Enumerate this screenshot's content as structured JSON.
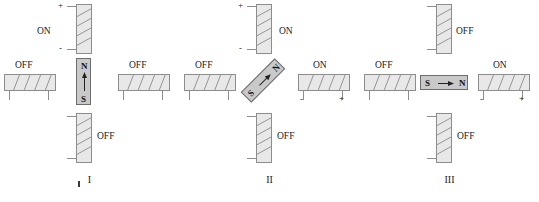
{
  "figure": {
    "type": "physics-diagram",
    "background_color": "#ffffff",
    "magnet_fill": "#c9c9c9",
    "coil_fill": "#e8e8e8",
    "stroke_color": "#8d8d8d",
    "labels": {
      "on": "ON",
      "off": "OFF",
      "plus": "+",
      "minus": "-",
      "north": "N",
      "south": "S"
    }
  },
  "panels": [
    {
      "id": "I",
      "caption": "I",
      "magnet": {
        "orientation": "vertical",
        "top_pole": "N",
        "bottom_pole": "S",
        "arrow_direction": "up",
        "angle_deg": 0
      },
      "coils": {
        "top": {
          "state": "ON",
          "label": "ON",
          "label_side": "left",
          "plus": "+",
          "minus": "-",
          "terminals_side": "left"
        },
        "left": {
          "state": "OFF",
          "label": "OFF",
          "label_side": "above",
          "plus": "",
          "minus": "",
          "terminals_side": "below"
        },
        "right": {
          "state": "OFF",
          "label": "OFF",
          "label_side": "above",
          "plus": "",
          "minus": "",
          "terminals_side": "below"
        },
        "bottom": {
          "state": "OFF",
          "label": "OFF",
          "label_side": "right",
          "plus": "",
          "minus": "",
          "terminals_side": "left"
        }
      }
    },
    {
      "id": "II",
      "caption": "II",
      "magnet": {
        "orientation": "diagonal",
        "top_pole": "N",
        "bottom_pole": "S",
        "arrow_direction": "up-right",
        "angle_deg": -45
      },
      "coils": {
        "top": {
          "state": "ON",
          "label": "ON",
          "label_side": "right",
          "plus": "+",
          "minus": "-",
          "terminals_side": "left"
        },
        "left": {
          "state": "OFF",
          "label": "OFF",
          "label_side": "above",
          "plus": "",
          "minus": "",
          "terminals_side": "below"
        },
        "right": {
          "state": "ON",
          "label": "ON",
          "label_side": "above",
          "plus": "+",
          "minus": "-",
          "terminals_side": "below"
        },
        "bottom": {
          "state": "OFF",
          "label": "OFF",
          "label_side": "right",
          "plus": "",
          "minus": "",
          "terminals_side": "left"
        }
      }
    },
    {
      "id": "III",
      "caption": "III",
      "magnet": {
        "orientation": "horizontal",
        "left_pole": "S",
        "right_pole": "N",
        "arrow_direction": "right",
        "angle_deg": 90
      },
      "coils": {
        "top": {
          "state": "OFF",
          "label": "OFF",
          "label_side": "right",
          "plus": "",
          "minus": "",
          "terminals_side": "left"
        },
        "left": {
          "state": "OFF",
          "label": "OFF",
          "label_side": "above",
          "plus": "",
          "minus": "",
          "terminals_side": "below"
        },
        "right": {
          "state": "ON",
          "label": "ON",
          "label_side": "above",
          "plus": "+",
          "minus": "-",
          "terminals_side": "below"
        },
        "bottom": {
          "state": "OFF",
          "label": "OFF",
          "label_side": "right",
          "plus": "",
          "minus": "",
          "terminals_side": "left"
        }
      }
    }
  ]
}
